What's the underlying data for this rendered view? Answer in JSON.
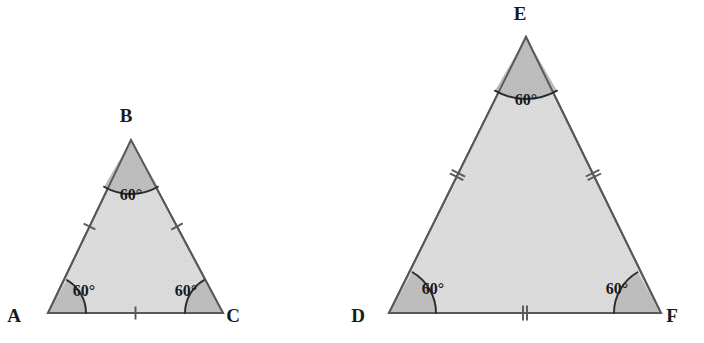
{
  "figure": {
    "width": 704,
    "height": 343,
    "background": "#ffffff",
    "fill_color": "#d8d8d8",
    "wedge_color": "#bcbcbc",
    "stroke_color": "#585858",
    "arc_color": "#2b2b2b",
    "label_color": "#1a1a1a"
  },
  "triangles": [
    {
      "id": "ABC",
      "name": "triangle-abc",
      "tick_count": 1,
      "vertices": [
        {
          "key": "A",
          "label": "A",
          "x": 48,
          "y": 313,
          "label_x": 14,
          "label_y": 322,
          "angle": "60°",
          "arc_radius": 38,
          "arc_start_deg": 0,
          "arc_end_deg": 60,
          "angle_label_x": 84,
          "angle_label_y": 296
        },
        {
          "key": "B",
          "label": "B",
          "x": 131,
          "y": 140,
          "label_x": 126,
          "label_y": 122,
          "angle": "60°",
          "arc_radius": 54,
          "arc_start_deg": 240,
          "arc_end_deg": 300,
          "angle_label_x": 131,
          "angle_label_y": 200
        },
        {
          "key": "C",
          "label": "C",
          "x": 223,
          "y": 313,
          "label_x": 233,
          "label_y": 322,
          "angle": "60°",
          "arc_radius": 38,
          "arc_start_deg": 120,
          "arc_end_deg": 180,
          "angle_label_x": 186,
          "angle_label_y": 296
        }
      ],
      "sides": [
        {
          "key": "AB",
          "name": "side-ab",
          "from": "A",
          "to": "B",
          "tick_t": 0.5,
          "tick_len": 13
        },
        {
          "key": "BC",
          "name": "side-bc",
          "from": "B",
          "to": "C",
          "tick_t": 0.5,
          "tick_len": 13
        },
        {
          "key": "AC",
          "name": "side-ac",
          "from": "A",
          "to": "C",
          "tick_t": 0.5,
          "tick_len": 13
        }
      ]
    },
    {
      "id": "DEF",
      "name": "triangle-def",
      "tick_count": 2,
      "vertices": [
        {
          "key": "D",
          "label": "D",
          "x": 389,
          "y": 313,
          "label_x": 358,
          "label_y": 322,
          "angle": "60°",
          "arc_radius": 47,
          "arc_start_deg": 0,
          "arc_end_deg": 60,
          "angle_label_x": 433,
          "angle_label_y": 294
        },
        {
          "key": "E",
          "label": "E",
          "x": 526,
          "y": 37,
          "label_x": 520,
          "label_y": 20,
          "angle": "60°",
          "arc_radius": 62,
          "arc_start_deg": 240,
          "arc_end_deg": 300,
          "angle_label_x": 526,
          "angle_label_y": 105
        },
        {
          "key": "F",
          "label": "F",
          "x": 661,
          "y": 313,
          "label_x": 672,
          "label_y": 322,
          "angle": "60°",
          "arc_radius": 47,
          "arc_start_deg": 120,
          "arc_end_deg": 180,
          "angle_label_x": 617,
          "angle_label_y": 294
        }
      ],
      "sides": [
        {
          "key": "DE",
          "name": "side-de",
          "from": "D",
          "to": "E",
          "tick_t": 0.5,
          "tick_len": 15
        },
        {
          "key": "EF",
          "name": "side-ef",
          "from": "E",
          "to": "F",
          "tick_t": 0.5,
          "tick_len": 15
        },
        {
          "key": "DF",
          "name": "side-df",
          "from": "D",
          "to": "F",
          "tick_t": 0.5,
          "tick_len": 15
        }
      ]
    }
  ]
}
